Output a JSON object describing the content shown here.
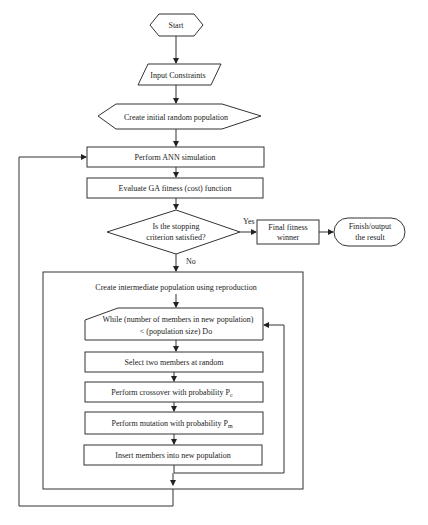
{
  "flowchart": {
    "start": "Start",
    "input": "Input Constraints",
    "init_population": "Create initial random population",
    "ann_simulation": "Perform ANN simulation",
    "evaluate": "Evaluate GA fitness (cost) function",
    "decision": {
      "line1": "Is the stopping",
      "line2": "criterion satisfied?",
      "yes_label": "Yes",
      "no_label": "No"
    },
    "final_fitness": {
      "line1": "Final fitness",
      "line2": "winner"
    },
    "finish": {
      "line1": "Finish/output",
      "line2": "the result"
    },
    "reproduction": {
      "title": "Create intermediate population using reproduction",
      "while_line1": "While   (number of members in new population)",
      "while_line2": "< (population size)    Do",
      "select": "Select two members at random",
      "crossover": "Perform crossover with probability P",
      "crossover_sub": "c",
      "mutation": "Perform mutation with probability P",
      "mutation_sub": "m",
      "insert": "Insert members into new population"
    }
  }
}
